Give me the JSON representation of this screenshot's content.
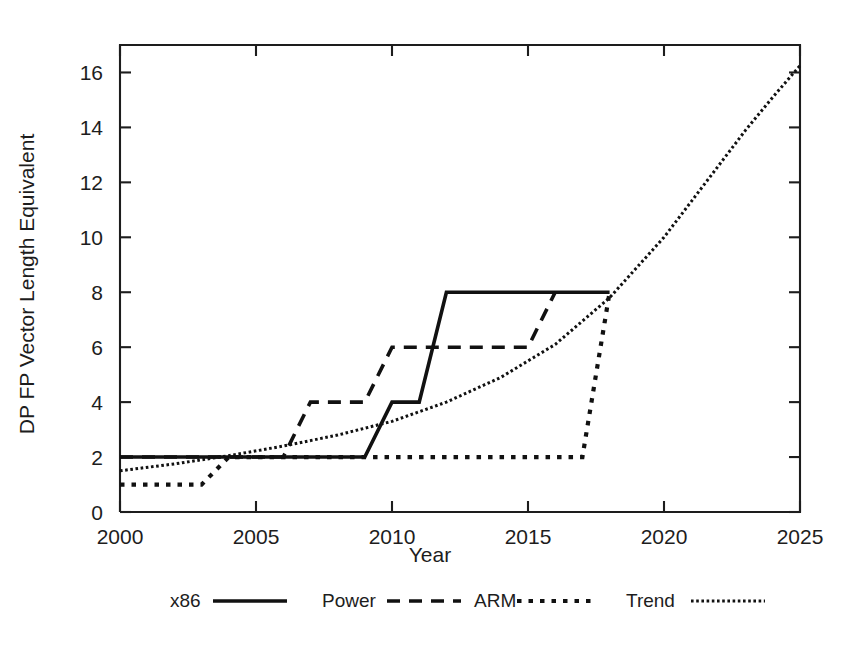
{
  "chart_data": {
    "type": "line",
    "title": "",
    "xlabel": "Year",
    "ylabel": "DP FP Vector Length Equivalent",
    "xlim": [
      2000,
      2025
    ],
    "ylim": [
      0,
      17
    ],
    "xticks": [
      2000,
      2005,
      2010,
      2015,
      2020,
      2025
    ],
    "xtick_labels": [
      "2000",
      "2005",
      "2010",
      "2015",
      "2020",
      "2025"
    ],
    "yticks": [
      0,
      2,
      4,
      6,
      8,
      10,
      12,
      14,
      16
    ],
    "ytick_labels": [
      "0",
      "2",
      "4",
      "6",
      "8",
      "10",
      "12",
      "14",
      "16"
    ],
    "grid": false,
    "legend_position": "below",
    "series": [
      {
        "name": "x86",
        "style": "solid",
        "dash": "none",
        "width": 3.6,
        "points": [
          [
            2000,
            2
          ],
          [
            2009,
            2
          ],
          [
            2010,
            4
          ],
          [
            2011,
            4
          ],
          [
            2012,
            8
          ],
          [
            2018,
            8
          ]
        ]
      },
      {
        "name": "Power",
        "style": "dashed",
        "dash": "13,9",
        "width": 3.6,
        "points": [
          [
            2000,
            2
          ],
          [
            2006,
            2
          ],
          [
            2007,
            4
          ],
          [
            2009,
            4
          ],
          [
            2010,
            6
          ],
          [
            2015,
            6
          ],
          [
            2016,
            8
          ]
        ]
      },
      {
        "name": "ARM",
        "style": "dotted",
        "dash": "4.5,7",
        "width": 4.2,
        "points": [
          [
            2000,
            1
          ],
          [
            2003,
            1
          ],
          [
            2004,
            2
          ],
          [
            2017,
            2
          ],
          [
            2018,
            8
          ]
        ]
      },
      {
        "name": "Trend",
        "style": "fine-dotted",
        "dash": "2.6,2.6",
        "width": 3.0,
        "points": [
          [
            2000,
            1.5
          ],
          [
            2002,
            1.75
          ],
          [
            2004,
            2.05
          ],
          [
            2006,
            2.4
          ],
          [
            2008,
            2.8
          ],
          [
            2010,
            3.3
          ],
          [
            2012,
            4.0
          ],
          [
            2014,
            4.9
          ],
          [
            2016,
            6.1
          ],
          [
            2018,
            7.8
          ],
          [
            2020,
            10.0
          ],
          [
            2021,
            11.3
          ],
          [
            2022,
            12.6
          ],
          [
            2023,
            13.9
          ],
          [
            2024,
            15.1
          ],
          [
            2025,
            16.25
          ]
        ]
      }
    ],
    "legend": [
      {
        "label": "x86",
        "dash": "none",
        "width": 3.6
      },
      {
        "label": "Power",
        "dash": "13,9",
        "width": 3.6
      },
      {
        "label": "ARM",
        "dash": "4.5,7",
        "width": 4.2
      },
      {
        "label": "Trend",
        "dash": "2.6,2.6",
        "width": 3.0
      }
    ],
    "colors": {
      "foreground": "#111111",
      "axis": "#1d1d1d",
      "background": "#ffffff"
    }
  }
}
